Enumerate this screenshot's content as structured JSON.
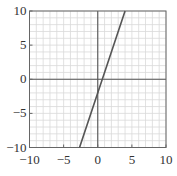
{
  "chart_data": {
    "type": "line",
    "title": "",
    "xlabel": "",
    "ylabel": "",
    "xlim": [
      -10,
      10
    ],
    "ylim": [
      -10,
      10
    ],
    "grid": true,
    "minor_grid_step": 1,
    "major_tick_step": 5,
    "x_tick_labels": [
      "−10",
      "−5",
      "0",
      "5",
      "10"
    ],
    "y_tick_labels": [
      "10",
      "5",
      "0",
      "−5",
      "−10"
    ],
    "x_ticks": [
      -10,
      -5,
      0,
      5,
      10
    ],
    "y_ticks": [
      10,
      5,
      0,
      -5,
      -10
    ],
    "series": [
      {
        "name": "y = 3x - 2",
        "equation": "y = 3x - 2",
        "x": [
          -2.667,
          4
        ],
        "y": [
          -10,
          10
        ],
        "color": "#555555"
      }
    ],
    "colors": {
      "grid": "#d9d9d9",
      "axis": "#555555",
      "frame": "#666666",
      "line": "#555555"
    }
  }
}
